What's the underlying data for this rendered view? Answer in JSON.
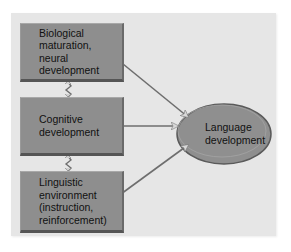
{
  "diagram": {
    "title": "",
    "nodes": [
      {
        "id": "bio",
        "lines": [
          "Biological",
          "maturation,",
          "neural",
          "development"
        ]
      },
      {
        "id": "cog",
        "lines": [
          "Cognitive",
          "development"
        ]
      },
      {
        "id": "env",
        "lines": [
          "Linguistic",
          "environment",
          "(instruction,",
          "reinforcement)"
        ]
      },
      {
        "id": "lang",
        "lines": [
          "Language",
          "development"
        ],
        "shape": "ellipse"
      }
    ],
    "edges": [
      {
        "from": "bio",
        "to": "cog",
        "type": "bidirectional"
      },
      {
        "from": "cog",
        "to": "env",
        "type": "bidirectional"
      },
      {
        "from": "bio",
        "to": "lang",
        "type": "bidirectional"
      },
      {
        "from": "cog",
        "to": "lang",
        "type": "bidirectional"
      },
      {
        "from": "env",
        "to": "lang",
        "type": "bidirectional"
      }
    ],
    "colors": {
      "panel": "#e6e6e6",
      "box_fill": "#8e8e8e",
      "ellipse_fill": "#8f8f8f",
      "arrow": "#6e6e6e"
    }
  }
}
